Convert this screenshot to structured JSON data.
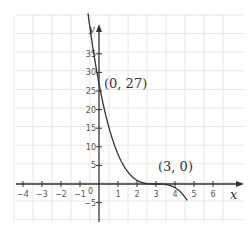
{
  "chart_data": {
    "type": "line",
    "title": "",
    "xlabel": "x",
    "ylabel": "y",
    "function": "y = -(x - 3)^3",
    "xlim": [
      -4.5,
      7.5
    ],
    "ylim": [
      -8,
      45
    ],
    "x_ticks": [
      "-4",
      "-3",
      "-2",
      "-1",
      "1",
      "2",
      "3",
      "4",
      "5",
      "6"
    ],
    "y_ticks": [
      "-5",
      "5",
      "10",
      "15",
      "20",
      "25",
      "30",
      "35"
    ],
    "origin_label": "0",
    "grid": true,
    "series": [
      {
        "name": "curve",
        "x": [
          -0.5,
          0,
          0.5,
          1,
          1.5,
          2,
          2.5,
          3,
          3.5,
          4,
          4.5
        ],
        "values": [
          42.9,
          27,
          15.6,
          8,
          3.4,
          1,
          0.1,
          0,
          -0.1,
          -1,
          -3.4
        ]
      }
    ],
    "annotations": [
      {
        "label": "(0, 27)",
        "x": 0,
        "y": 27
      },
      {
        "label": "(3, 0)",
        "x": 3,
        "y": 0
      }
    ]
  }
}
